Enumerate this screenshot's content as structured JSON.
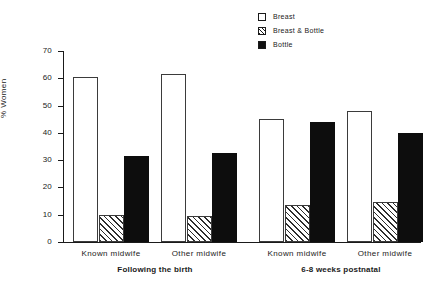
{
  "chart_data": {
    "type": "bar",
    "title": "",
    "subtitle": "",
    "xlabel": "",
    "ylabel": "% Women",
    "ylim": [
      0,
      70
    ],
    "yticks": [
      0,
      10,
      20,
      30,
      40,
      50,
      60,
      70
    ],
    "grid": false,
    "legend_position": "top-right",
    "categories": [
      "Known midwife",
      "Other midwife",
      "Known midwife",
      "Other midwife"
    ],
    "group_labels": [
      "Following the birth",
      "6-8 weeks postnatal"
    ],
    "series": [
      {
        "name": "Breast",
        "values": [
          60.5,
          61.5,
          45.0,
          48.0
        ]
      },
      {
        "name": "Breast & Bottle",
        "values": [
          10.0,
          9.5,
          13.5,
          14.5
        ]
      },
      {
        "name": "Bottle",
        "values": [
          31.5,
          32.5,
          44.0,
          40.0
        ]
      }
    ]
  },
  "legend": {
    "items": [
      {
        "label": "Breast",
        "style": "outline"
      },
      {
        "label": "Breast & Bottle",
        "style": "hatched"
      },
      {
        "label": "Bottle",
        "style": "solid"
      }
    ]
  },
  "axes": {
    "y_title": "% Women",
    "y_ticks": [
      "0",
      "10",
      "20",
      "30",
      "40",
      "50",
      "60",
      "70"
    ]
  },
  "x_axis": {
    "categories": [
      "Known midwife",
      "Other midwife",
      "Known midwife",
      "Other midwife"
    ],
    "groups": [
      "Following the birth",
      "6-8 weeks postnatal"
    ]
  },
  "colors": {
    "ink": "#1a1a1a",
    "bar_outline": "#3b3b3b",
    "bar_fill_white": "#ffffff",
    "bar_fill_solid": "#0d0d0d",
    "background": "#ffffff"
  }
}
